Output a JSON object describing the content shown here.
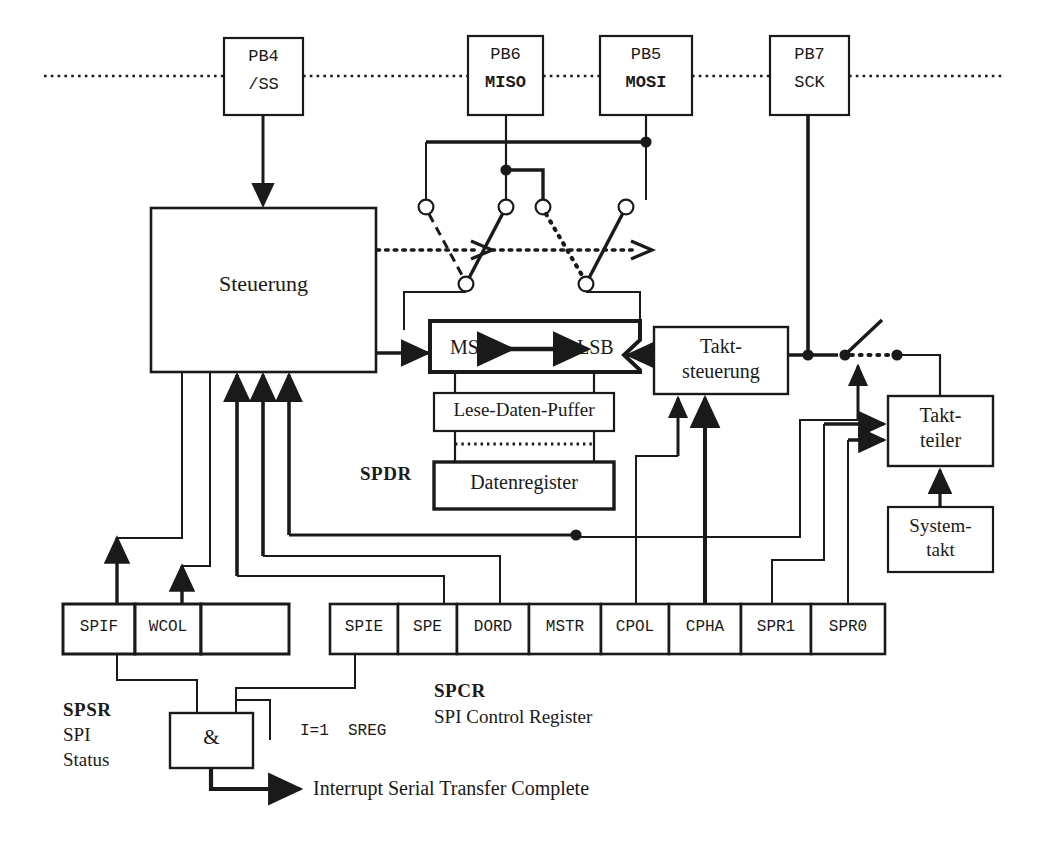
{
  "diagram": {
    "colors": {
      "ink": "#1a1a1a",
      "paper": "#ffffff"
    },
    "pins": [
      {
        "id": "pb4",
        "line1": "PB4",
        "line2": "/SS",
        "bold2": false
      },
      {
        "id": "pb6",
        "line1": "PB6",
        "line2": "MISO",
        "bold2": true
      },
      {
        "id": "pb5",
        "line1": "PB5",
        "line2": "MOSI",
        "bold2": true
      },
      {
        "id": "pb7",
        "line1": "PB7",
        "line2": "SCK",
        "bold2": false
      }
    ],
    "blocks": {
      "steuerung": "Steuerung",
      "shift_msb": "MSB",
      "shift_lsb": "LSB",
      "lese_daten_puffer": "Lese-Daten-Puffer",
      "datenregister": "Datenregister",
      "takt_steuerung_l1": "Takt-",
      "takt_steuerung_l2": "steuerung",
      "takt_teiler_l1": "Takt-",
      "takt_teiler_l2": "teiler",
      "system_takt_l1": "System-",
      "system_takt_l2": "takt",
      "and_gate": "&"
    },
    "registers": {
      "spdr_label": "SPDR",
      "spsr": {
        "name": "SPSR",
        "desc_line1": "SPI",
        "desc_line2": "Status",
        "bits": [
          "SPIF",
          "WCOL",
          ""
        ]
      },
      "spcr": {
        "name": "SPCR",
        "desc": "SPI Control Register",
        "bits": [
          "SPIE",
          "SPE",
          "DORD",
          "MSTR",
          "CPOL",
          "CPHA",
          "SPR1",
          "SPR0"
        ]
      }
    },
    "annotations": {
      "sreg": "I=1  SREG",
      "interrupt": "Interrupt Serial Transfer Complete"
    }
  }
}
